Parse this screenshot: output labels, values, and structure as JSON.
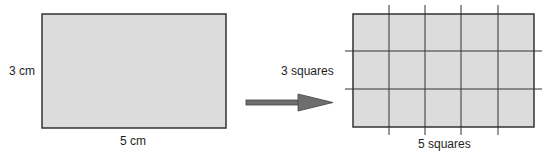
{
  "left_figure": {
    "height_label": "3 cm",
    "width_label": "5 cm",
    "fill": "#dcdcdc",
    "stroke": "#333333"
  },
  "arrow": {
    "fill": "#707070",
    "stroke": "#333333"
  },
  "right_figure": {
    "rows_label": "3 squares",
    "cols_label": "5 squares",
    "rows": 3,
    "cols": 5,
    "fill": "#dcdcdc",
    "stroke": "#333333"
  }
}
